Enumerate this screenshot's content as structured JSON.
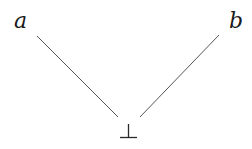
{
  "diagram": {
    "type": "hasse-diagram",
    "nodes": [
      {
        "id": "a",
        "label": "a",
        "x": 20,
        "y": 27
      },
      {
        "id": "b",
        "label": "b",
        "x": 236,
        "y": 27
      },
      {
        "id": "bottom",
        "label": "⊥",
        "symbol": "bottom",
        "x": 128,
        "y": 138
      }
    ],
    "edges": [
      {
        "from": "a",
        "to": "bottom"
      },
      {
        "from": "b",
        "to": "bottom"
      }
    ],
    "colors": {
      "background": "#ffffff",
      "text": "#1a1a1a",
      "edge": "#555555"
    }
  }
}
